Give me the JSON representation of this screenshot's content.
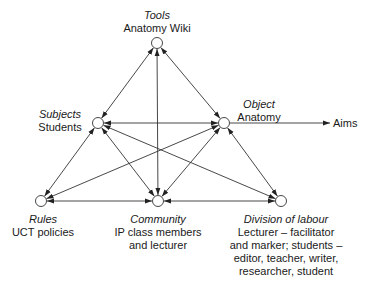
{
  "diagram": {
    "nodes": [
      {
        "id": "tools",
        "role": "Tools",
        "value": [
          "Anatomy Wiki"
        ]
      },
      {
        "id": "subjects",
        "role": "Subjects",
        "value": [
          "Students"
        ]
      },
      {
        "id": "object",
        "role": "Object",
        "value": [
          "Anatomy"
        ]
      },
      {
        "id": "rules",
        "role": "Rules",
        "value": [
          "UCT policies"
        ]
      },
      {
        "id": "community",
        "role": "Community",
        "value": [
          "IP class members",
          "and lecturer"
        ]
      },
      {
        "id": "division",
        "role": "Division of labour",
        "value": [
          "Lecturer – facilitator",
          "and marker; students –",
          "editor, teacher, writer,",
          "researcher, student"
        ]
      }
    ],
    "edges": [
      {
        "from": "tools",
        "to": "subjects",
        "bidirectional": true
      },
      {
        "from": "tools",
        "to": "object",
        "bidirectional": true
      },
      {
        "from": "tools",
        "to": "community",
        "bidirectional": true
      },
      {
        "from": "subjects",
        "to": "object",
        "bidirectional": true
      },
      {
        "from": "subjects",
        "to": "rules",
        "bidirectional": true
      },
      {
        "from": "subjects",
        "to": "community",
        "bidirectional": true
      },
      {
        "from": "subjects",
        "to": "division",
        "bidirectional": true
      },
      {
        "from": "object",
        "to": "rules",
        "bidirectional": true
      },
      {
        "from": "object",
        "to": "community",
        "bidirectional": true
      },
      {
        "from": "object",
        "to": "division",
        "bidirectional": true
      },
      {
        "from": "rules",
        "to": "community",
        "bidirectional": true
      },
      {
        "from": "community",
        "to": "division",
        "bidirectional": true
      }
    ],
    "outcome": {
      "from": "object",
      "label": "Aims"
    },
    "colors": {
      "line": "#333333",
      "node_fill": "#ffffff",
      "text": "#1a1a1a"
    }
  }
}
